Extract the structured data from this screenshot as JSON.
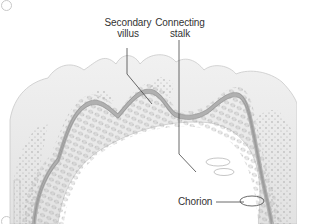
{
  "figure": {
    "type": "anatomical-diagram",
    "labels": [
      {
        "id": "secondary-villus",
        "line1": "Secondary",
        "line2": "villus"
      },
      {
        "id": "connecting-stalk",
        "line1": "Connecting",
        "line2": "stalk"
      },
      {
        "id": "chorion",
        "line1": "Chorion",
        "line2": ""
      }
    ],
    "colors": {
      "outline": "#9a9a9a",
      "fill_outer": "#ececec",
      "epithelium": "#b5b5b5",
      "leader_line": "#444444",
      "text": "#333333"
    }
  }
}
